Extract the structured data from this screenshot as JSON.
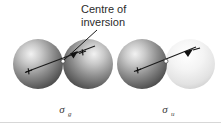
{
  "figure": {
    "title": "Centre of inversion",
    "width": 221,
    "height": 125,
    "background_color": "#ffffff"
  },
  "annotation": {
    "line1": "Centre",
    "line1_full": "Centre of",
    "line2": "inversion",
    "word_of": "of",
    "leader_from": [
      97,
      27
    ],
    "leader_to": [
      63,
      61
    ],
    "text_color": "#2b2b2b"
  },
  "molecules": [
    {
      "id": "sigma-g",
      "label_sigma": "σ",
      "label_subscript": "g",
      "label_full": "σg",
      "label_x": 62,
      "label_y": 112,
      "description": "bonding sigma g molecular orbital, both lobes same phase",
      "center_of_inversion": [
        63,
        61
      ],
      "axis_start": [
        26,
        72
      ],
      "axis_end": [
        95,
        46
      ],
      "lobes": [
        {
          "side": "left",
          "cx": 38,
          "cy": 64,
          "r": 25,
          "phase_sign": "+",
          "shade": "dark",
          "fill_center": "#e8e8e8",
          "fill_edge": "#4a4a4a",
          "sign_x": 28,
          "sign_y": 74
        },
        {
          "side": "right",
          "cx": 88,
          "cy": 64,
          "r": 25,
          "phase_sign": "+",
          "shade": "dark",
          "fill_center": "#e8e8e8",
          "fill_edge": "#4a4a4a",
          "sign_x": 82,
          "sign_y": 56
        }
      ]
    },
    {
      "id": "sigma-u",
      "label_sigma": "σ",
      "label_subscript": "u",
      "label_full": "σu",
      "label_x": 165,
      "label_y": 112,
      "description": "antibonding sigma u molecular orbital, lobes of opposite phase",
      "center_of_inversion": [
        166,
        61
      ],
      "axis_start": [
        136,
        71
      ],
      "axis_end": [
        196,
        47
      ],
      "lobes": [
        {
          "side": "left",
          "cx": 142,
          "cy": 64,
          "r": 25,
          "phase_sign": "+",
          "shade": "dark",
          "fill_center": "#e8e8e8",
          "fill_edge": "#4a4a4a",
          "sign_x": 133,
          "sign_y": 73
        },
        {
          "side": "right",
          "cx": 190,
          "cy": 64,
          "r": 25,
          "phase_sign": "−",
          "shade": "light",
          "fill_center": "#ffffff",
          "fill_edge": "#c2c2c2",
          "sign_x": 186,
          "sign_y": 55
        }
      ]
    }
  ],
  "baseline_rule": {
    "visible": true,
    "y": 122,
    "color": "#d7d7d7"
  }
}
